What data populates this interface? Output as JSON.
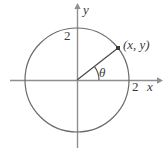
{
  "figure": {
    "type": "unit-circle-diagram",
    "colors": {
      "stroke": "#5a5a5a",
      "axis": "#8a8a8a",
      "text": "#3b3b3b",
      "background": "#ffffff"
    },
    "geometry": {
      "center": {
        "x": 77,
        "y": 80
      },
      "radius_px": 52,
      "point": {
        "x": 118,
        "y": 48
      },
      "angle_deg": 38,
      "arc_radius_px": 22
    },
    "axes": {
      "x_axis": {
        "label": "x",
        "tick_label": "2",
        "start_x": 10,
        "end_x": 161,
        "y": 80
      },
      "y_axis": {
        "label": "y",
        "tick_label": "2",
        "start_y": 148,
        "end_y": 5,
        "x": 77
      }
    },
    "labels": {
      "point_label": "(x, y)",
      "angle_label": "θ",
      "x_axis_label": "x",
      "y_axis_label": "y",
      "x_tick_label": "2",
      "y_tick_label": "2"
    }
  }
}
